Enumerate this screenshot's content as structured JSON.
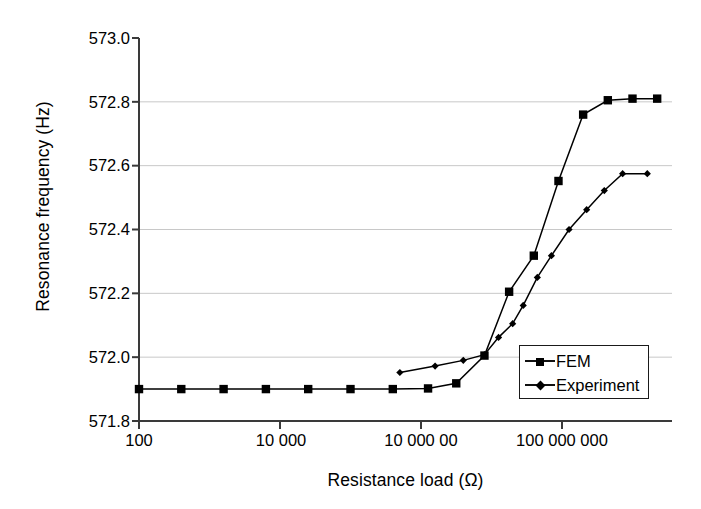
{
  "chart_data": {
    "type": "line",
    "title": "",
    "xlabel": "Resistance load (Ω)",
    "ylabel": "Resonance frequency (Hz)",
    "xscale": "log",
    "xlim": [
      100,
      1000000000
    ],
    "ylim": [
      571.8,
      573.0
    ],
    "grid": "horizontal",
    "legend_position": "lower-right-inside",
    "xticks": [
      {
        "value": 100,
        "label": "100"
      },
      {
        "value": 10000,
        "label": "10 000"
      },
      {
        "value": 1000000,
        "label": "10 000 00"
      },
      {
        "value": 100000000,
        "label": "100 000 000"
      }
    ],
    "yticks": [
      {
        "value": 573.0,
        "label": "573.0"
      },
      {
        "value": 572.8,
        "label": "572.8"
      },
      {
        "value": 572.6,
        "label": "572.6"
      },
      {
        "value": 572.4,
        "label": "572.4"
      },
      {
        "value": 572.2,
        "label": "572.2"
      },
      {
        "value": 572.0,
        "label": "572.0"
      },
      {
        "value": 571.8,
        "label": "571.8"
      }
    ],
    "series": [
      {
        "name": "FEM",
        "marker": "square",
        "color": "#000000",
        "points": [
          {
            "x": 100,
            "y": 571.9
          },
          {
            "x": 398,
            "y": 571.9
          },
          {
            "x": 1585,
            "y": 571.9
          },
          {
            "x": 6310,
            "y": 571.9
          },
          {
            "x": 25119,
            "y": 571.9
          },
          {
            "x": 100000,
            "y": 571.9
          },
          {
            "x": 398107,
            "y": 571.9
          },
          {
            "x": 1258925,
            "y": 571.902
          },
          {
            "x": 3162278,
            "y": 571.918
          },
          {
            "x": 7943282,
            "y": 572.005
          },
          {
            "x": 17782794,
            "y": 572.205
          },
          {
            "x": 39810717,
            "y": 572.318
          },
          {
            "x": 89125094,
            "y": 572.552
          },
          {
            "x": 199526231,
            "y": 572.76
          },
          {
            "x": 446683592,
            "y": 572.805
          },
          {
            "x": 1000000000,
            "y": 572.81
          },
          {
            "x": 2238721139,
            "y": 572.81
          },
          {
            "x": 5011872336,
            "y": 572.81
          },
          {
            "x": 11220184543,
            "y": 572.81
          },
          {
            "x": 25118864315,
            "y": 572.812
          },
          {
            "x": 56234132519,
            "y": 572.812
          },
          {
            "x": 125892541179,
            "y": 572.812
          }
        ]
      },
      {
        "name": "Experiment",
        "marker": "diamond",
        "color": "#000000",
        "points": [
          {
            "x": 501187,
            "y": 571.952
          },
          {
            "x": 1584893,
            "y": 571.972
          },
          {
            "x": 3981072,
            "y": 571.99
          },
          {
            "x": 7943282,
            "y": 572.008
          },
          {
            "x": 12589254,
            "y": 572.062
          },
          {
            "x": 19952623,
            "y": 572.105
          },
          {
            "x": 28183829,
            "y": 572.162
          },
          {
            "x": 44668359,
            "y": 572.25
          },
          {
            "x": 70794578,
            "y": 572.318
          },
          {
            "x": 125892541,
            "y": 572.4
          },
          {
            "x": 223872114,
            "y": 572.462
          },
          {
            "x": 398107171,
            "y": 572.522
          },
          {
            "x": 724435960,
            "y": 572.575
          },
          {
            "x": 1621810097,
            "y": 572.575
          }
        ]
      }
    ]
  },
  "legend": {
    "items": [
      {
        "label": "FEM",
        "marker": "square"
      },
      {
        "label": "Experiment",
        "marker": "diamond"
      }
    ]
  }
}
